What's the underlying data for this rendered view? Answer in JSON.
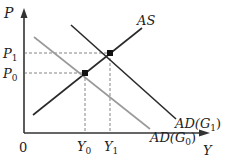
{
  "diagram": {
    "axes": {
      "y_label": "P",
      "x_label": "Y",
      "origin_label": "0"
    },
    "price_levels": [
      {
        "label": "P",
        "sub": "1"
      },
      {
        "label": "P",
        "sub": "0"
      }
    ],
    "output_levels": [
      {
        "label": "Y",
        "sub": "0"
      },
      {
        "label": "Y",
        "sub": "1"
      }
    ],
    "curves": {
      "as": {
        "label": "AS",
        "color": "#2a2a2a"
      },
      "ad_g1": {
        "label": "AD(G",
        "sub": "1",
        "close": ")",
        "color": "#2a2a2a"
      },
      "ad_g0": {
        "label": "AD(G",
        "sub": "0",
        "close": ")",
        "color": "#9a9a9a"
      }
    },
    "points": [
      {
        "name": "equilibrium-0",
        "x_label": "Y0",
        "y_label": "P0"
      },
      {
        "name": "equilibrium-1",
        "x_label": "Y1",
        "y_label": "P1"
      }
    ]
  }
}
